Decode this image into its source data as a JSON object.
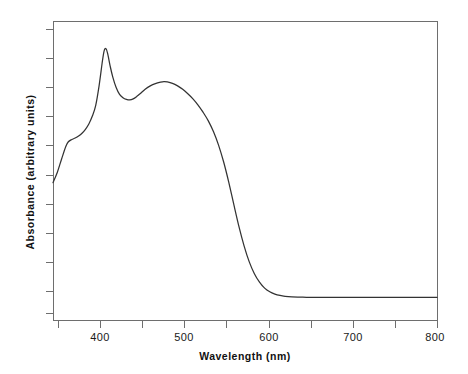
{
  "chart_data": {
    "type": "line",
    "title": "",
    "xlabel": "Wavelength (nm)",
    "ylabel": "Absorbance (arbitrary units)",
    "xlim": [
      350,
      800
    ],
    "ylim": [
      0,
      1.06
    ],
    "grid": false,
    "legend": null,
    "xticks": [
      400,
      500,
      600,
      700,
      800
    ],
    "xtick_labels": [
      "400",
      "500",
      "600",
      "700",
      "800"
    ],
    "xminor_ticks": [
      350,
      450,
      550,
      650,
      750
    ],
    "yticks_unlabeled": 10,
    "series": [
      {
        "name": "Absorbance",
        "color": "#333333",
        "x": [
          350,
          355,
          360,
          365,
          368,
          372,
          376,
          380,
          384,
          388,
          392,
          396,
          400,
          404,
          408,
          410,
          412,
          414,
          417,
          420,
          424,
          428,
          432,
          436,
          440,
          444,
          448,
          452,
          458,
          464,
          470,
          476,
          480,
          484,
          490,
          496,
          502,
          508,
          514,
          520,
          526,
          532,
          538,
          544,
          550,
          556,
          562,
          568,
          574,
          580,
          586,
          592,
          598,
          604,
          610,
          616,
          622,
          630,
          640,
          650,
          660,
          680,
          700,
          720,
          740,
          760,
          780,
          800
        ],
        "y": [
          0.487,
          0.523,
          0.57,
          0.615,
          0.632,
          0.64,
          0.645,
          0.652,
          0.662,
          0.676,
          0.695,
          0.722,
          0.76,
          0.83,
          0.92,
          0.955,
          0.962,
          0.945,
          0.9,
          0.862,
          0.824,
          0.8,
          0.788,
          0.782,
          0.78,
          0.784,
          0.792,
          0.802,
          0.818,
          0.83,
          0.838,
          0.843,
          0.845,
          0.844,
          0.839,
          0.83,
          0.818,
          0.802,
          0.784,
          0.762,
          0.736,
          0.706,
          0.668,
          0.62,
          0.56,
          0.488,
          0.408,
          0.33,
          0.262,
          0.206,
          0.164,
          0.134,
          0.113,
          0.1,
          0.092,
          0.087,
          0.084,
          0.082,
          0.081,
          0.08,
          0.08,
          0.08,
          0.08,
          0.08,
          0.08,
          0.08,
          0.08,
          0.08
        ]
      }
    ],
    "annotations": {
      "soret_peak_nm": 412,
      "q_band_peak_nm": 480,
      "shoulder_nm": 368,
      "valley_nm": 440,
      "baseline_onset_nm": 630
    }
  }
}
